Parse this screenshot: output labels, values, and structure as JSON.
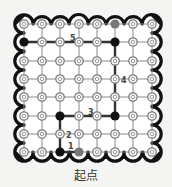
{
  "caption": "起点",
  "grid": {
    "cols": 8,
    "rows": 8,
    "x": [
      24,
      42,
      60,
      79,
      97,
      115,
      133,
      152
    ],
    "y": [
      24,
      42,
      61,
      79,
      97,
      116,
      134,
      152
    ]
  },
  "colors": {
    "background": "#f4f4f2",
    "border": "#111111",
    "grid_line": "#8a8a8a",
    "path_line": "#333333",
    "node_ring": "#7a7a7a",
    "black_node": "#111111",
    "gray_node": "#777777"
  },
  "special_nodes": [
    {
      "col": 0,
      "row": 1,
      "type": "black"
    },
    {
      "col": 5,
      "row": 1,
      "type": "black"
    },
    {
      "col": 5,
      "row": 0,
      "type": "gray"
    },
    {
      "col": 2,
      "row": 5,
      "type": "black"
    },
    {
      "col": 5,
      "row": 5,
      "type": "black"
    },
    {
      "col": 2,
      "row": 7,
      "type": "black"
    },
    {
      "col": 3,
      "row": 7,
      "type": "gray"
    }
  ],
  "path": [
    [
      0,
      1
    ],
    [
      5,
      1
    ],
    [
      5,
      5
    ],
    [
      2,
      5
    ],
    [
      2,
      7
    ],
    [
      3,
      7
    ]
  ],
  "labels": [
    {
      "text": "5",
      "x": 70,
      "y": 41
    },
    {
      "text": "4",
      "x": 121,
      "y": 83
    },
    {
      "text": "3",
      "x": 88,
      "y": 115
    },
    {
      "text": "2",
      "x": 66,
      "y": 138
    },
    {
      "text": "1",
      "x": 68,
      "y": 149
    }
  ]
}
